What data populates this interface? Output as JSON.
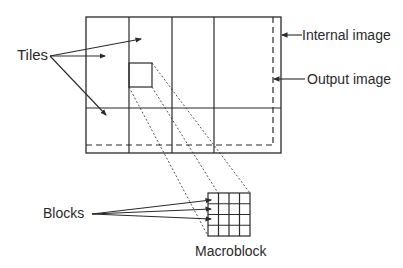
{
  "labels": {
    "tiles": "Tiles",
    "internal_image": "Internal image",
    "output_image": "Output image",
    "blocks": "Blocks",
    "macroblock": "Macroblock"
  },
  "colors": {
    "line": "#2a2a2a",
    "background": "#ffffff"
  },
  "structure": {
    "tile_columns": 4,
    "tile_rows": 2,
    "macroblock_grid": "4x4"
  }
}
